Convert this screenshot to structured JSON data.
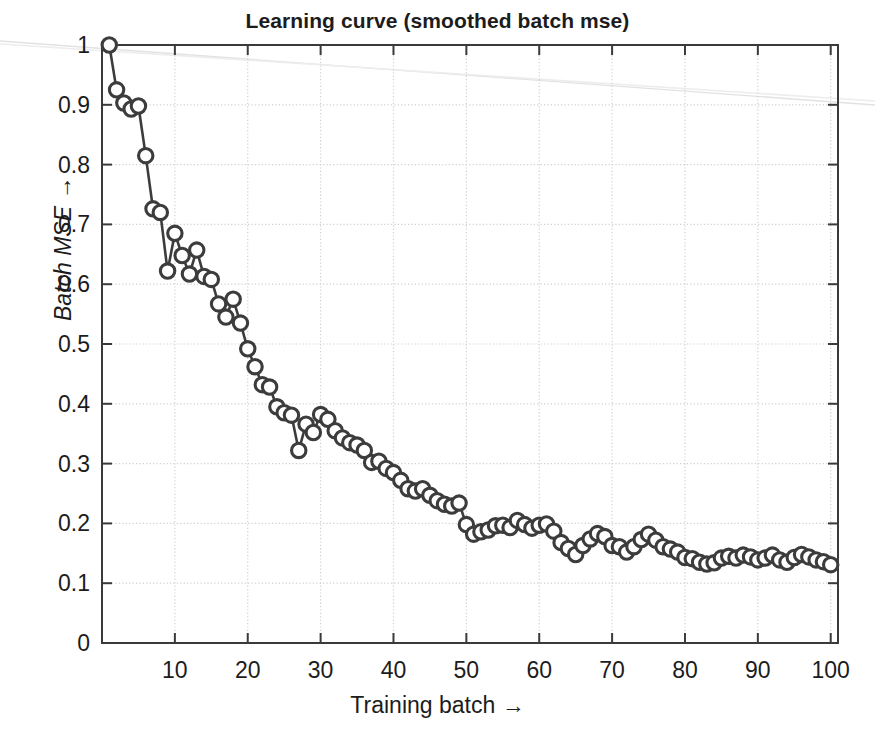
{
  "chart_data": {
    "type": "line",
    "title": "Learning curve (smoothed batch mse)",
    "xlabel": "Training batch →",
    "ylabel": "Batch MSE →",
    "xlim": [
      0,
      101
    ],
    "ylim": [
      0,
      1
    ],
    "grid": true,
    "legend": "none",
    "marker": "open-circle",
    "marker_color": "#3c3c3c",
    "line_color": "#3c3c3c",
    "xticks": [
      10,
      20,
      30,
      40,
      50,
      60,
      70,
      80,
      90,
      100
    ],
    "xtick_labels": [
      "10",
      "20",
      "30",
      "40",
      "50",
      "60",
      "70",
      "80",
      "90",
      "100"
    ],
    "yticks": [
      0,
      0.1,
      0.2,
      0.3,
      0.4,
      0.5,
      0.6,
      0.7,
      0.8,
      0.9,
      1
    ],
    "ytick_labels": [
      "0",
      "0.1",
      "0.2",
      "0.3",
      "0.4",
      "0.5",
      "0.6",
      "0.7",
      "0.8",
      "0.9",
      "1"
    ],
    "x": [
      1,
      2,
      3,
      4,
      5,
      6,
      7,
      8,
      9,
      10,
      11,
      12,
      13,
      14,
      15,
      16,
      17,
      18,
      19,
      20,
      21,
      22,
      23,
      24,
      25,
      26,
      27,
      28,
      29,
      30,
      31,
      32,
      33,
      34,
      35,
      36,
      37,
      38,
      39,
      40,
      41,
      42,
      43,
      44,
      45,
      46,
      47,
      48,
      49,
      50,
      51,
      52,
      53,
      54,
      55,
      56,
      57,
      58,
      59,
      60,
      61,
      62,
      63,
      64,
      65,
      66,
      67,
      68,
      69,
      70,
      71,
      72,
      73,
      74,
      75,
      76,
      77,
      78,
      79,
      80,
      81,
      82,
      83,
      84,
      85,
      86,
      87,
      88,
      89,
      90,
      91,
      92,
      93,
      94,
      95,
      96,
      97,
      98,
      99,
      100
    ],
    "y": [
      1.0,
      0.925,
      0.903,
      0.893,
      0.898,
      0.815,
      0.726,
      0.72,
      0.622,
      0.685,
      0.648,
      0.617,
      0.657,
      0.613,
      0.608,
      0.567,
      0.545,
      0.575,
      0.535,
      0.492,
      0.462,
      0.432,
      0.428,
      0.395,
      0.385,
      0.381,
      0.322,
      0.366,
      0.352,
      0.382,
      0.374,
      0.355,
      0.343,
      0.335,
      0.331,
      0.322,
      0.302,
      0.304,
      0.292,
      0.285,
      0.272,
      0.258,
      0.254,
      0.258,
      0.247,
      0.238,
      0.232,
      0.229,
      0.234,
      0.198,
      0.182,
      0.186,
      0.189,
      0.196,
      0.197,
      0.193,
      0.205,
      0.198,
      0.192,
      0.197,
      0.199,
      0.187,
      0.168,
      0.158,
      0.148,
      0.163,
      0.174,
      0.183,
      0.178,
      0.163,
      0.161,
      0.152,
      0.161,
      0.173,
      0.182,
      0.172,
      0.161,
      0.157,
      0.152,
      0.143,
      0.141,
      0.135,
      0.132,
      0.134,
      0.142,
      0.145,
      0.142,
      0.147,
      0.144,
      0.139,
      0.142,
      0.147,
      0.139,
      0.135,
      0.143,
      0.148,
      0.144,
      0.139,
      0.136,
      0.131
    ]
  }
}
